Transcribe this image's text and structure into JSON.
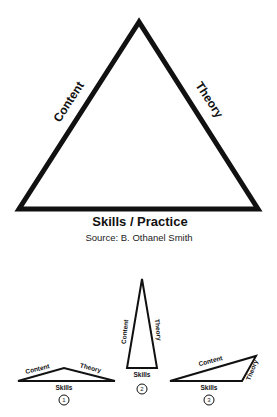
{
  "main_triangle": {
    "left_side_label": "Content",
    "right_side_label": "Theory",
    "base_label": "Skills / Practice",
    "source": "Source:  B. Othanel Smith"
  },
  "variants": [
    {
      "number": "1",
      "left_label": "Content",
      "right_label": "Theory",
      "base_label": "Skills"
    },
    {
      "number": "2",
      "left_label": "Content",
      "right_label": "Theory",
      "base_label": "Skills"
    },
    {
      "number": "3",
      "left_label": "Content",
      "right_label": "Theory",
      "base_label": "Skills"
    }
  ],
  "colors": {
    "stroke": "#111111",
    "background": "#ffffff"
  }
}
